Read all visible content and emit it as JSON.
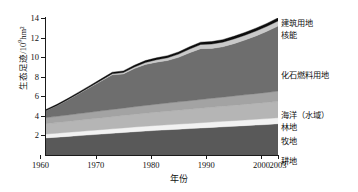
{
  "chart_data": {
    "type": "area",
    "stacked": true,
    "title": "",
    "xlabel": "年份",
    "ylabel": "生态足迹/10⁹hm²",
    "ylabel_main": "生态足迹/10",
    "ylabel_exp": "9",
    "ylabel_unit": "hm²",
    "grid": false,
    "legend_position": "right",
    "xlim": [
      1961,
      2003
    ],
    "ylim": [
      0,
      14
    ],
    "xticks": [
      1960,
      1970,
      1980,
      1990,
      2000,
      2003
    ],
    "xtick_labels": [
      "1960",
      "1970",
      "1980",
      "1990",
      "2000",
      "2003"
    ],
    "yticks": [
      2,
      4,
      6,
      8,
      10,
      12,
      14
    ],
    "ytick_labels": [
      "2",
      "4",
      "6",
      "8",
      "10",
      "12",
      "14"
    ],
    "x": [
      1961,
      1963,
      1965,
      1967,
      1969,
      1971,
      1973,
      1975,
      1977,
      1979,
      1981,
      1983,
      1985,
      1987,
      1989,
      1991,
      1993,
      1995,
      1997,
      1999,
      2001,
      2003
    ],
    "series": [
      {
        "name": "耕地",
        "color": "#595959",
        "values": [
          1.75,
          1.82,
          1.9,
          1.98,
          2.06,
          2.14,
          2.22,
          2.3,
          2.38,
          2.45,
          2.52,
          2.58,
          2.64,
          2.7,
          2.76,
          2.82,
          2.88,
          2.94,
          3.0,
          3.06,
          3.12,
          3.2
        ]
      },
      {
        "name": "牧地",
        "color": "#f2f2f2",
        "values": [
          0.4,
          0.41,
          0.42,
          0.43,
          0.44,
          0.45,
          0.46,
          0.47,
          0.48,
          0.49,
          0.5,
          0.51,
          0.52,
          0.53,
          0.54,
          0.55,
          0.56,
          0.57,
          0.58,
          0.59,
          0.6,
          0.61
        ]
      },
      {
        "name": "林地",
        "color": "#b5b5b5",
        "values": [
          1.05,
          1.08,
          1.11,
          1.14,
          1.17,
          1.2,
          1.23,
          1.26,
          1.29,
          1.32,
          1.35,
          1.38,
          1.41,
          1.44,
          1.47,
          1.5,
          1.53,
          1.56,
          1.59,
          1.62,
          1.65,
          1.68
        ]
      },
      {
        "name": "海洋（水域）",
        "color": "#a3a3a3",
        "values": [
          0.62,
          0.64,
          0.66,
          0.68,
          0.7,
          0.72,
          0.74,
          0.76,
          0.78,
          0.8,
          0.82,
          0.84,
          0.86,
          0.88,
          0.9,
          0.92,
          0.94,
          0.96,
          0.98,
          1.0,
          1.02,
          1.04
        ]
      },
      {
        "name": "化石燃料用地",
        "color": "#6e6e6e",
        "values": [
          0.72,
          1.1,
          1.55,
          2.05,
          2.55,
          3.05,
          3.55,
          3.5,
          3.9,
          4.2,
          4.3,
          4.35,
          4.55,
          4.9,
          5.2,
          5.1,
          5.15,
          5.35,
          5.6,
          5.9,
          6.25,
          6.65
        ]
      },
      {
        "name": "核能",
        "color": "#c9c9c9",
        "values": [
          0.01,
          0.02,
          0.03,
          0.04,
          0.05,
          0.07,
          0.1,
          0.13,
          0.16,
          0.2,
          0.24,
          0.28,
          0.33,
          0.38,
          0.42,
          0.45,
          0.47,
          0.48,
          0.49,
          0.5,
          0.51,
          0.52
        ]
      },
      {
        "name": "建筑用地",
        "color": "#0d0d0d",
        "values": [
          0.1,
          0.11,
          0.12,
          0.13,
          0.14,
          0.15,
          0.16,
          0.17,
          0.18,
          0.19,
          0.2,
          0.21,
          0.22,
          0.23,
          0.24,
          0.25,
          0.26,
          0.27,
          0.28,
          0.29,
          0.3,
          0.31
        ]
      }
    ],
    "legend": [
      {
        "label": "建筑用地",
        "color": "#0d0d0d"
      },
      {
        "label": "核能",
        "color": "#c9c9c9"
      },
      {
        "label": "化石燃料用地",
        "color": "#6e6e6e"
      },
      {
        "label": "海洋（水域）",
        "color": "#a3a3a3"
      },
      {
        "label": "林地",
        "color": "#b5b5b5"
      },
      {
        "label": "牧地",
        "color": "#f2f2f2"
      },
      {
        "label": "耕地",
        "color": "#595959"
      }
    ],
    "legend_y_px": [
      20,
      32,
      72,
      112,
      124,
      138,
      158
    ]
  }
}
